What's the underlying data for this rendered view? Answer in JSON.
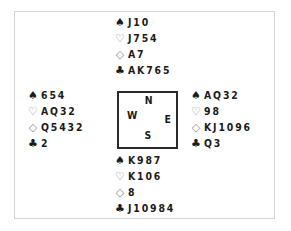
{
  "diagram": {
    "type": "bridge-deal",
    "compass": {
      "north": "N",
      "south": "S",
      "east": "E",
      "west": "W"
    },
    "suits": {
      "spades": "♠",
      "hearts": "♡",
      "diamonds": "◇",
      "clubs": "♣"
    },
    "hands": {
      "north": {
        "spades": "J10",
        "hearts": "J754",
        "diamonds": "A7",
        "clubs": "AK765"
      },
      "west": {
        "spades": "654",
        "hearts": "AQ32",
        "diamonds": "Q5432",
        "clubs": "2"
      },
      "east": {
        "spades": "AQ32",
        "hearts": "98",
        "diamonds": "KJ1096",
        "clubs": "Q3"
      },
      "south": {
        "spades": "K987",
        "hearts": "K106",
        "diamonds": "8",
        "clubs": "J10984"
      }
    }
  }
}
